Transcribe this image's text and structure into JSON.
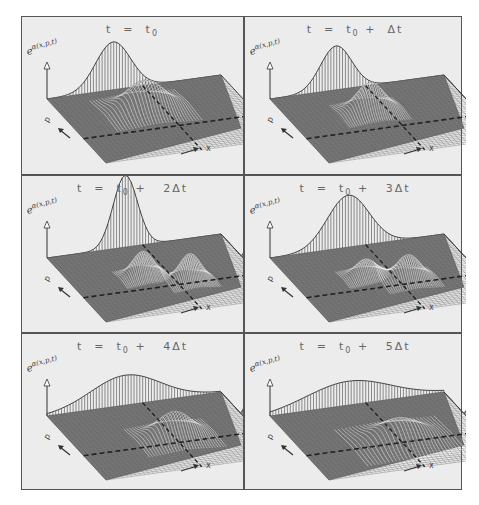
{
  "figure": {
    "layout": {
      "rows": 3,
      "cols": 2
    },
    "ylabel": "e",
    "ylabel_exponent": "α(x,p,t)",
    "axis_labels": {
      "p": "p",
      "x": "x"
    },
    "colors": {
      "background": "#ececec",
      "grid": "#7a7a7a",
      "border": "#555555",
      "text": "#666666",
      "dashed_line": "#222222"
    },
    "panels": [
      {
        "id": "t0",
        "title_t": "t",
        "title_eq": "=",
        "title_base": "t",
        "title_sub": "0",
        "title_suffix": "",
        "left_wall_peaks": [
          {
            "pos": 0.38,
            "height": 48,
            "width": 0.1
          }
        ],
        "right_wall_peaks": [
          {
            "pos": 0.55,
            "height": 42,
            "width": 0.05
          }
        ],
        "surface_peaks": [
          {
            "u": 0.45,
            "v": 0.35,
            "height": 30,
            "width": 0.11
          }
        ]
      },
      {
        "id": "t1",
        "title_t": "t",
        "title_eq": "=",
        "title_base": "t",
        "title_sub": "0",
        "title_suffix": "+  Δt",
        "left_wall_peaks": [
          {
            "pos": 0.38,
            "height": 44,
            "width": 0.09
          }
        ],
        "right_wall_peaks": [
          {
            "pos": 0.55,
            "height": 44,
            "width": 0.04
          },
          {
            "pos": 0.8,
            "height": 6,
            "width": 0.04
          }
        ],
        "surface_peaks": [
          {
            "u": 0.45,
            "v": 0.38,
            "height": 30,
            "width": 0.08
          }
        ]
      },
      {
        "id": "t2",
        "title_t": "t",
        "title_eq": "=",
        "title_base": "t",
        "title_sub": "0",
        "title_suffix": "+   2Δt",
        "left_wall_peaks": [
          {
            "pos": 0.45,
            "height": 72,
            "width": 0.07
          }
        ],
        "right_wall_peaks": [
          {
            "pos": 0.45,
            "height": 26,
            "width": 0.04
          },
          {
            "pos": 0.75,
            "height": 26,
            "width": 0.04
          }
        ],
        "surface_peaks": [
          {
            "u": 0.4,
            "v": 0.45,
            "height": 26,
            "width": 0.06
          },
          {
            "u": 0.62,
            "v": 0.6,
            "height": 28,
            "width": 0.06
          }
        ]
      },
      {
        "id": "t3",
        "title_t": "t",
        "title_eq": "=",
        "title_base": "t",
        "title_sub": "0",
        "title_suffix": "+   3Δt",
        "left_wall_peaks": [
          {
            "pos": 0.45,
            "height": 52,
            "width": 0.12
          }
        ],
        "right_wall_peaks": [
          {
            "pos": 0.45,
            "height": 16,
            "width": 0.03
          },
          {
            "pos": 0.75,
            "height": 36,
            "width": 0.04
          }
        ],
        "surface_peaks": [
          {
            "u": 0.4,
            "v": 0.45,
            "height": 18,
            "width": 0.06
          },
          {
            "u": 0.6,
            "v": 0.58,
            "height": 26,
            "width": 0.07
          }
        ]
      },
      {
        "id": "t4",
        "title_t": "t",
        "title_eq": "=",
        "title_base": "t",
        "title_sub": "0",
        "title_suffix": "+   4Δt",
        "left_wall_peaks": [
          {
            "pos": 0.45,
            "height": 30,
            "width": 0.2
          }
        ],
        "right_wall_peaks": [
          {
            "pos": 0.4,
            "height": 10,
            "width": 0.03
          },
          {
            "pos": 0.75,
            "height": 38,
            "width": 0.04
          }
        ],
        "surface_peaks": [
          {
            "u": 0.55,
            "v": 0.55,
            "height": 26,
            "width": 0.1
          }
        ]
      },
      {
        "id": "t5",
        "title_t": "t",
        "title_eq": "=",
        "title_base": "t",
        "title_sub": "0",
        "title_suffix": "+   5Δt",
        "left_wall_peaks": [
          {
            "pos": 0.45,
            "height": 24,
            "width": 0.24
          }
        ],
        "right_wall_peaks": [
          {
            "pos": 0.4,
            "height": 8,
            "width": 0.03
          },
          {
            "pos": 0.75,
            "height": 40,
            "width": 0.04
          }
        ],
        "surface_peaks": [
          {
            "u": 0.55,
            "v": 0.6,
            "height": 22,
            "width": 0.13
          }
        ]
      }
    ]
  }
}
